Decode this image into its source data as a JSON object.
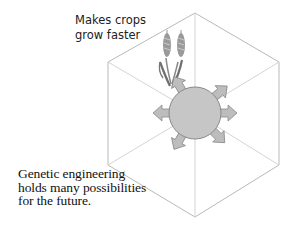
{
  "diagram": {
    "top_label": "Makes crops\ngrow faster",
    "caption": "Genetic engineering\nholds many possibilities\nfor the future.",
    "colors": {
      "hexagon_stroke": "#b9b9b9",
      "circle_fill": "#c6c6c6",
      "circle_stroke": "#8a8a8a",
      "arrow_fill": "#bdbdbd",
      "wheat": "#7a7a7a"
    },
    "hexagon_vertices": [
      [
        195,
        13
      ],
      [
        279,
        62
      ],
      [
        279,
        165
      ],
      [
        195,
        217
      ],
      [
        108,
        165
      ],
      [
        108,
        62
      ]
    ],
    "center": [
      195,
      113
    ],
    "circle_radius": 26,
    "arrow_directions": [
      "up-left",
      "up-right",
      "left",
      "right",
      "down-left",
      "down-right"
    ],
    "icons": [
      "wheat-icon",
      "cell-sphere-icon",
      "arrow-icon"
    ]
  }
}
